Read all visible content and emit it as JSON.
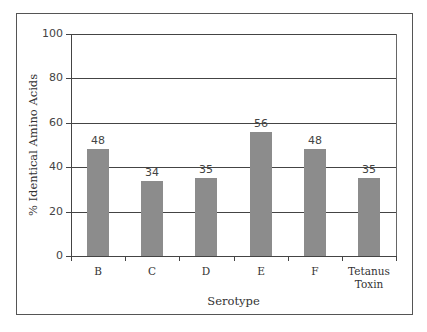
{
  "chart_data": {
    "type": "bar",
    "title": "",
    "xlabel": "Serotype",
    "ylabel": "% Identical Amino Acids",
    "categories": [
      "B",
      "C",
      "D",
      "E",
      "F",
      "Tetanus Toxin"
    ],
    "category_lines": [
      [
        "B"
      ],
      [
        "C"
      ],
      [
        "D"
      ],
      [
        "E"
      ],
      [
        "F"
      ],
      [
        "Tetanus",
        "Toxin"
      ]
    ],
    "values": [
      48,
      34,
      35,
      56,
      48,
      35
    ],
    "data_labels": [
      "48",
      "34",
      "35",
      "56",
      "48",
      "35"
    ],
    "ylim": [
      0,
      100
    ],
    "yticks": [
      0,
      20,
      40,
      60,
      80,
      100
    ],
    "ytick_labels": [
      "0",
      "20",
      "40",
      "60",
      "80",
      "100"
    ],
    "grid": true,
    "legend": null,
    "bar_color": "#8c8c8c"
  }
}
